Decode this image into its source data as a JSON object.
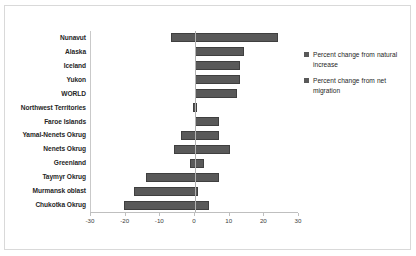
{
  "chart_data": {
    "type": "bar",
    "orientation": "horizontal",
    "title": "",
    "xlabel": "",
    "ylabel": "",
    "xlim": [
      -30,
      30
    ],
    "xticks": [
      -30,
      -20,
      -10,
      0,
      10,
      20,
      30
    ],
    "xtick_labels": [
      "-30",
      "-20",
      "-10",
      "0",
      "10",
      "20",
      "30"
    ],
    "grid": false,
    "legend_position": "right",
    "bar_color": "#595959",
    "categories": [
      "Nunavut",
      "Alaska",
      "Iceland",
      "Yukon",
      "WORLD",
      "Northwest Territories",
      "Faroe Islands",
      "Yamal-Nenets Okrug",
      "Nenets Okrug",
      "Greenland",
      "Taymyr Okrug",
      "Murmansk oblast",
      "Chukotka Okrug"
    ],
    "series": [
      {
        "name": "Percent change from natural increase",
        "values": [
          -7,
          0,
          0,
          0,
          0,
          -0.6,
          0,
          -4,
          -6,
          -1.5,
          -14,
          -17.5,
          -20.5
        ]
      },
      {
        "name": "Percent change from net migration",
        "values": [
          24,
          14,
          13,
          13,
          12,
          0.6,
          7,
          7,
          10,
          2.5,
          7,
          1,
          4
        ]
      }
    ],
    "bars": [
      {
        "category": "Nunavut",
        "start": -7,
        "end": 24
      },
      {
        "category": "Alaska",
        "start": 0,
        "end": 14
      },
      {
        "category": "Iceland",
        "start": 0,
        "end": 13
      },
      {
        "category": "Yukon",
        "start": 0,
        "end": 13
      },
      {
        "category": "WORLD",
        "start": 0,
        "end": 12
      },
      {
        "category": "Northwest Territories",
        "start": -0.6,
        "end": 0.6
      },
      {
        "category": "Faroe Islands",
        "start": 0,
        "end": 7
      },
      {
        "category": "Yamal-Nenets Okrug",
        "start": -4,
        "end": 7
      },
      {
        "category": "Nenets Okrug",
        "start": -6,
        "end": 10
      },
      {
        "category": "Greenland",
        "start": -1.5,
        "end": 2.5
      },
      {
        "category": "Taymyr Okrug",
        "start": -14,
        "end": 7
      },
      {
        "category": "Murmansk oblast",
        "start": -17.5,
        "end": 1
      },
      {
        "category": "Chukotka Okrug",
        "start": -20.5,
        "end": 4
      }
    ]
  },
  "legend": {
    "entries": [
      {
        "label": "Percent change from natural increase",
        "color": "#595959"
      },
      {
        "label": "Percent change from net migration",
        "color": "#595959"
      }
    ]
  }
}
